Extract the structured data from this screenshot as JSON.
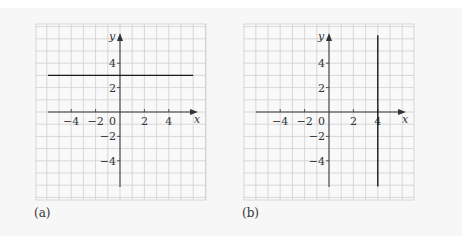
{
  "figure": {
    "background": "#f7f7f7",
    "grid_color": "#cfcfcf",
    "axis_color": "#333333",
    "line_color": "#1a1a1a",
    "unit_px": 12.2,
    "panels": [
      {
        "id": "a",
        "caption": "(a)",
        "origin": [
          120,
          112
        ],
        "grid_box": [
          36,
          24,
          206,
          200
        ],
        "x_axis": {
          "label": "x",
          "from_px": 48,
          "to_px": 198,
          "ticks": [
            -4,
            -2,
            2,
            4
          ],
          "tick_labels": [
            "−4",
            "−2",
            "2",
            "4"
          ]
        },
        "y_axis": {
          "label": "y",
          "from_px": 187,
          "to_px": 33,
          "ticks": [
            4,
            2,
            -2,
            -4
          ],
          "tick_labels": [
            "4",
            "2",
            "−2",
            "−4"
          ]
        },
        "origin_label": "0",
        "graph": {
          "type": "horizontal-line",
          "equation": "y = 3",
          "y": 3,
          "x_from": -5.9,
          "x_to": 6.0
        }
      },
      {
        "id": "b",
        "caption": "(b)",
        "origin": [
          329,
          112
        ],
        "grid_box": [
          244,
          24,
          414,
          200
        ],
        "x_axis": {
          "label": "x",
          "from_px": 256,
          "to_px": 406,
          "ticks": [
            -4,
            -2,
            2,
            4
          ],
          "tick_labels": [
            "−4",
            "−2",
            "2",
            "4"
          ]
        },
        "y_axis": {
          "label": "y",
          "from_px": 187,
          "to_px": 33,
          "ticks": [
            4,
            2,
            -2,
            -4
          ],
          "tick_labels": [
            "4",
            "2",
            "−2",
            "−4"
          ]
        },
        "origin_label": "0",
        "graph": {
          "type": "vertical-line",
          "equation": "x = 4",
          "x": 4,
          "y_from": -6.1,
          "y_to": 6.3
        }
      }
    ]
  },
  "chart_data": [
    {
      "type": "line",
      "title": "(a)",
      "xlabel": "x",
      "ylabel": "y",
      "xlim": [
        -6,
        6
      ],
      "ylim": [
        -6,
        6
      ],
      "grid": true,
      "x_ticks": [
        -4,
        -2,
        0,
        2,
        4
      ],
      "y_ticks": [
        -4,
        -2,
        2,
        4
      ],
      "series": [
        {
          "name": "y = 3",
          "x": [
            -5.9,
            6.0
          ],
          "y": [
            3,
            3
          ]
        }
      ]
    },
    {
      "type": "line",
      "title": "(b)",
      "xlabel": "x",
      "ylabel": "y",
      "xlim": [
        -6,
        6
      ],
      "ylim": [
        -6,
        6
      ],
      "grid": true,
      "x_ticks": [
        -4,
        -2,
        0,
        2,
        4
      ],
      "y_ticks": [
        -4,
        -2,
        2,
        4
      ],
      "series": [
        {
          "name": "x = 4",
          "x": [
            4,
            4
          ],
          "y": [
            -6.1,
            6.3
          ]
        }
      ]
    }
  ]
}
